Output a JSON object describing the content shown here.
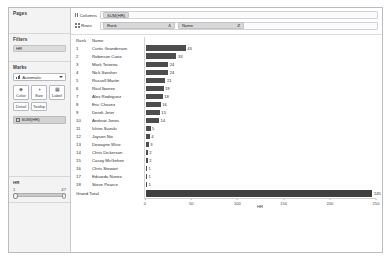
{
  "left_pane": {
    "pages": {
      "title": "Pages"
    },
    "filters": {
      "title": "Filters",
      "pills": [
        {
          "label": "HR",
          "icon": "measure-icon"
        }
      ]
    },
    "marks": {
      "title": "Marks",
      "mark_type": "Automatic",
      "mark_type_icon": "bar-chart-icon",
      "dropdown_icon": "chevron-down-icon",
      "buttons": [
        {
          "label": "Color",
          "icon": "color-palette-icon"
        },
        {
          "label": "Size",
          "icon": "size-icon"
        },
        {
          "label": "Label",
          "icon": "label-icon"
        },
        {
          "label": "Detail",
          "icon": "detail-icon"
        },
        {
          "label": "Tooltip",
          "icon": "tooltip-icon"
        }
      ],
      "pills": [
        {
          "label": "SUM(HR)",
          "icon": "label-pill-icon"
        }
      ]
    },
    "filter_slider": {
      "title": "HR",
      "min_label": "1",
      "max_label": "47",
      "handle_left_name": "slider-handle-min",
      "handle_right_name": "slider-handle-max"
    }
  },
  "shelves": {
    "columns": {
      "label": "Columns",
      "icon": "columns-icon",
      "pills": [
        {
          "label": "SUM(HR)"
        }
      ]
    },
    "rows": {
      "label": "Rows",
      "icon": "rows-icon",
      "pills": [
        {
          "label": "Rank",
          "sort_icon": "Δ"
        },
        {
          "label": "Name",
          "sort_icon": "⇵"
        }
      ]
    }
  },
  "table": {
    "headers": {
      "rank": "Rank",
      "name": "Name"
    },
    "total_label": "Grand Total"
  },
  "chart_data": {
    "type": "bar",
    "title": "",
    "xlabel": "HR",
    "ylabel": "",
    "orientation": "horizontal",
    "xlim": [
      0,
      250
    ],
    "xticks": [
      0,
      50,
      100,
      150,
      200,
      250
    ],
    "grid": false,
    "legend": "none",
    "categories": [
      "Curtis Granderson",
      "Robinson Cano",
      "Mark Teixeira",
      "Nick Swisher",
      "Russell Martin",
      "Raul Ibanez",
      "Alex Rodriguez",
      "Eric Chavez",
      "Derek Jeter",
      "Andruw Jones",
      "Ichiro Suzuki",
      "Jayson Nix",
      "Dewayne Wise",
      "Chris Dickerson",
      "Casey McGehee",
      "Chris Stewart",
      "Eduardo Nunez",
      "Steve Pearce"
    ],
    "ranks": [
      1,
      2,
      3,
      4,
      5,
      6,
      7,
      8,
      9,
      10,
      11,
      12,
      13,
      14,
      15,
      16,
      17,
      18
    ],
    "values": [
      43,
      33,
      24,
      24,
      21,
      19,
      18,
      16,
      15,
      14,
      5,
      4,
      3,
      2,
      2,
      1,
      1,
      1
    ],
    "total": 245
  }
}
